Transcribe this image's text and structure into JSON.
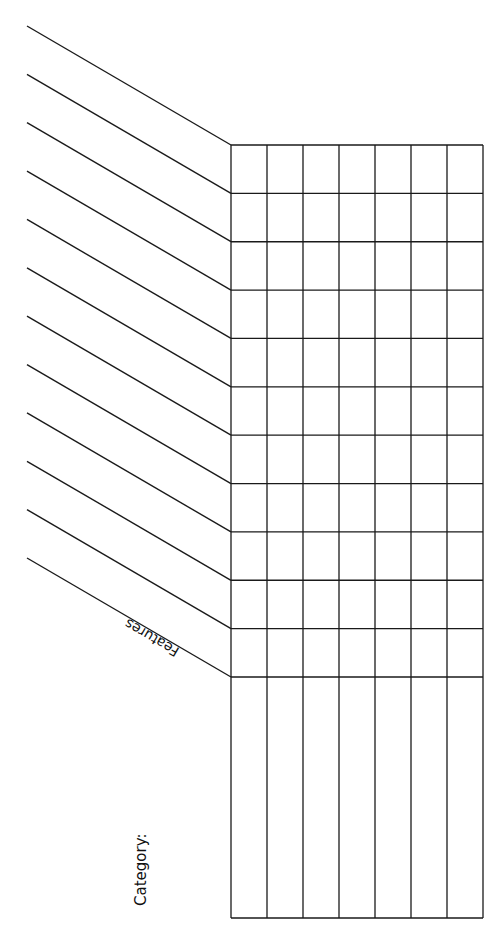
{
  "diagram": {
    "type": "blank-comparison-grid",
    "labels": {
      "features": "Features",
      "category": "Category:"
    },
    "grid": {
      "left": 231,
      "right": 483,
      "top": 145,
      "bottom": 918,
      "columns": 7,
      "feature_rows": 11,
      "row_line_spacing": 48.3,
      "header_bottom": 677
    },
    "diagonals": {
      "count": 12,
      "start_x": 27,
      "start_y_first": 26,
      "end_x": 231,
      "end_y_first": 145
    },
    "colors": {
      "line": "#1a1a1a",
      "background": "#ffffff"
    }
  }
}
